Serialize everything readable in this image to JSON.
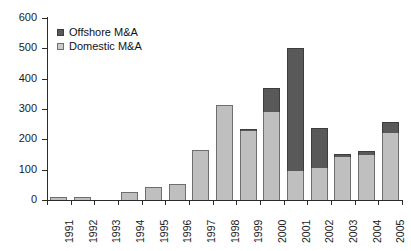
{
  "chart_data": {
    "type": "bar",
    "subtype": "stacked-vertical",
    "title": "",
    "xlabel": "",
    "ylabel": "",
    "ylim": [
      0,
      600
    ],
    "yticks": [
      0,
      100,
      200,
      300,
      400,
      500,
      600
    ],
    "ytick_labels": [
      "0",
      "100",
      "200",
      "300",
      "400",
      "500",
      "600"
    ],
    "grid": false,
    "legend_position": "top-left",
    "categories": [
      "1991",
      "1992",
      "1993",
      "1994",
      "1995",
      "1996",
      "1997",
      "1998",
      "1999",
      "2000",
      "2001",
      "2002",
      "2003",
      "2004",
      "2005"
    ],
    "series": [
      {
        "name": "Domestic M&A",
        "color": "#bfbfbf",
        "values": [
          10,
          11,
          0,
          27,
          42,
          52,
          165,
          313,
          228,
          290,
          95,
          105,
          143,
          148,
          222
        ]
      },
      {
        "name": "Offshore M&A",
        "color": "#595959",
        "values": [
          0,
          0,
          0,
          0,
          0,
          0,
          0,
          0,
          5,
          80,
          405,
          133,
          9,
          15,
          36
        ]
      }
    ],
    "totals": [
      10,
      11,
      0,
      27,
      42,
      52,
      165,
      313,
      233,
      370,
      500,
      238,
      152,
      163,
      258
    ]
  },
  "legend": {
    "items": [
      {
        "label": "Offshore M&A",
        "key": "offshore"
      },
      {
        "label": "Domestic M&A",
        "key": "domestic"
      }
    ]
  },
  "colors": {
    "offshore": "#595959",
    "domestic": "#bfbfbf",
    "axis": "#2b2b2b",
    "background": "#ffffff"
  }
}
